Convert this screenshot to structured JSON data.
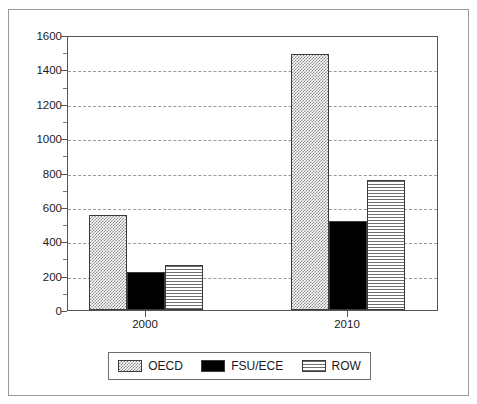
{
  "chart_data": {
    "type": "bar",
    "title": "",
    "subtitle": "",
    "xlabel": "",
    "ylabel": "",
    "categories": [
      "2000",
      "2010"
    ],
    "series": [
      {
        "name": "OECD",
        "values": [
          555,
          1490
        ],
        "pattern": "checker",
        "color": "#8a8a8a"
      },
      {
        "name": "FSU/ECE",
        "values": [
          220,
          515
        ],
        "pattern": "solid",
        "color": "#000000"
      },
      {
        "name": "ROW",
        "values": [
          260,
          755
        ],
        "pattern": "hlines",
        "color": "#6e6e6e"
      }
    ],
    "ylim": [
      0,
      1600
    ],
    "ytick_values": [
      0,
      200,
      400,
      600,
      800,
      1000,
      1200,
      1400,
      1600
    ],
    "ytick_labels": [
      "0",
      "200",
      "400",
      "600",
      "800",
      "1000",
      "1200",
      "1400",
      "1600"
    ],
    "yminor_values": [
      100,
      300,
      500,
      700,
      900,
      1100,
      1300,
      1500
    ],
    "grid": true,
    "grid_axis": "y",
    "grid_style": "dashed",
    "grid_color": "#9a9a9a",
    "legend_position": "bottom",
    "legend_entries": [
      "OECD",
      "FSU/ECE",
      "ROW"
    ],
    "frame_color": "#555555",
    "border_color": "#9a9a9a",
    "background": "#ffffff"
  }
}
